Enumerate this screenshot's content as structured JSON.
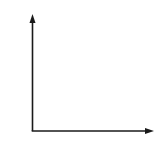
{
  "diagram": {
    "type": "empty-axes",
    "line_color": "#1a1a1a",
    "background": "#ffffff",
    "origin": {
      "x": 32.5,
      "y": 131
    },
    "y_axis": {
      "x": 32.5,
      "y_start": 131,
      "y_end": 15,
      "arrow": true,
      "label": ""
    },
    "x_axis": {
      "y": 131,
      "x_start": 32.5,
      "x_end": 153,
      "arrow": true,
      "label": ""
    }
  }
}
